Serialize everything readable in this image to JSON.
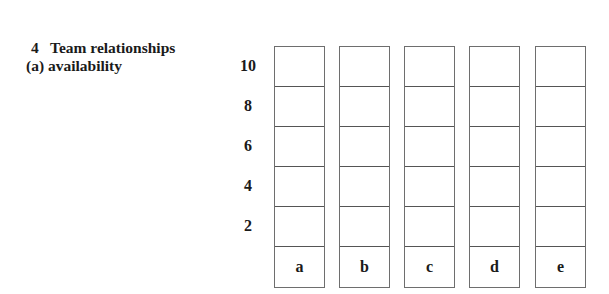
{
  "section": {
    "number": "4",
    "title": "Team relationships",
    "subtitle": "(a) availability"
  },
  "scale": {
    "labels": [
      "10",
      "8",
      "6",
      "4",
      "2"
    ]
  },
  "columns": [
    {
      "label": "a"
    },
    {
      "label": "b"
    },
    {
      "label": "c"
    },
    {
      "label": "d"
    },
    {
      "label": "e"
    }
  ]
}
